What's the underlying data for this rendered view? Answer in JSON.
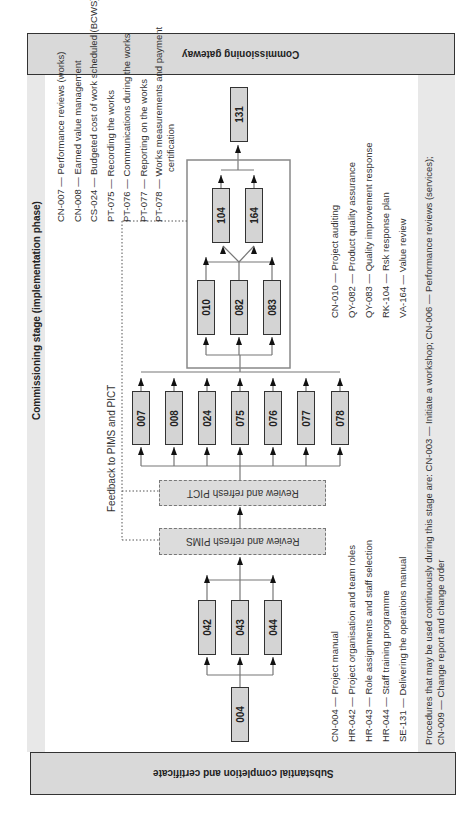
{
  "gateways": {
    "top": "Commissioning gateway",
    "bottom": "Substantial completion and certificate"
  },
  "stage_title": "Commissioning stage (implementation phase)",
  "feedback_label": "Feedback to PIMS and PICT",
  "review_boxes": {
    "pims": "Review and refresh PIMS",
    "pict": "Review and refresh PICT"
  },
  "nodes": {
    "start": "004",
    "group1": [
      "042",
      "043",
      "044"
    ],
    "group2": [
      "007",
      "008",
      "024",
      "075",
      "076",
      "077",
      "078"
    ],
    "group3": [
      "010",
      "082",
      "083"
    ],
    "group4": [
      "104",
      "164"
    ],
    "end": "131"
  },
  "legend_top": [
    "CN-007 — Performance reviews (works)",
    "CN-008 — Earned value management",
    "CS-024 — Budgeted cost of work scheduled (BCWS)",
    "PT-075 — Recording the works",
    "PT-076 — Communications during the works",
    "PT-077 — Reporting on the works",
    "PT-078 — Works measurements and payment",
    "certification"
  ],
  "legend_mid": [
    "CN-010 — Project auditing",
    "QY-082 — Product quality assurance",
    "QY-083 — Quality improvement response",
    "RK-104 — Rsk response plan",
    "VA-164 — Value review"
  ],
  "legend_bottom": [
    "CN-004 — Project manual",
    "HR-042 — Project organisation and team roles",
    "HR-043 — Role assignments and staff selection",
    "HR-044 — Staff training programme",
    "SE-131 — Delivering the operations manual"
  ],
  "procedures_note": [
    "Procedures that may be used continuously during this stage are: CN-003 — Initiate a workshop; CN-006 — Performance reviews (services);",
    "CN-009 — Change report and change order"
  ],
  "colors": {
    "bar_fill": "#d9d9d9",
    "node_fill": "#d4d4d4",
    "strip_fill": "#e8e8e8",
    "container_border": "#888888"
  }
}
